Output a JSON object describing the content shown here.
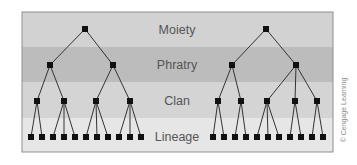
{
  "diagram": {
    "levels": [
      {
        "label": "Moiety",
        "y_top": 12,
        "y_bottom": 47,
        "color": "#d2d2d2"
      },
      {
        "label": "Phratry",
        "y_top": 47,
        "y_bottom": 82,
        "color": "#bcbcbc"
      },
      {
        "label": "Clan",
        "y_top": 82,
        "y_bottom": 118,
        "color": "#d4d4d4"
      },
      {
        "label": "Lineage",
        "y_top": 118,
        "y_bottom": 152,
        "color": "#e6e6e6"
      }
    ],
    "node_color": "#111111",
    "line_color": "#333333",
    "frame_color": "#8f8f8f",
    "credit": "© Cengage Learning",
    "trees": [
      {
        "name": "left-moiety",
        "moiety": {
          "x": 85,
          "y": 29
        },
        "phratries": [
          {
            "x": 50,
            "y": 65,
            "clans": [
              {
                "x": 37,
                "y": 101,
                "lineages": [
                  31,
                  42
                ]
              },
              {
                "x": 64,
                "y": 101,
                "lineages": [
                  53,
                  64,
                  75
                ]
              }
            ]
          },
          {
            "x": 113,
            "y": 65,
            "clans": [
              {
                "x": 96,
                "y": 101,
                "lineages": [
                  86,
                  97,
                  108
                ]
              },
              {
                "x": 130,
                "y": 101,
                "lineages": [
                  119,
                  130,
                  141
                ]
              }
            ]
          }
        ]
      },
      {
        "name": "right-moiety",
        "moiety": {
          "x": 266,
          "y": 29
        },
        "phratries": [
          {
            "x": 232,
            "y": 65,
            "clans": [
              {
                "x": 218,
                "y": 101,
                "lineages": [
                  213,
                  224
                ]
              },
              {
                "x": 241,
                "y": 101,
                "lineages": [
                  235,
                  246
                ]
              }
            ]
          },
          {
            "x": 296,
            "y": 65,
            "clans": [
              {
                "x": 267,
                "y": 101,
                "lineages": [
                  257,
                  268,
                  279
                ]
              },
              {
                "x": 295,
                "y": 101,
                "lineages": [
                  290,
                  301
                ]
              },
              {
                "x": 317,
                "y": 101,
                "lineages": [
                  312,
                  323
                ]
              }
            ]
          }
        ]
      }
    ],
    "lineage_y": 137
  }
}
